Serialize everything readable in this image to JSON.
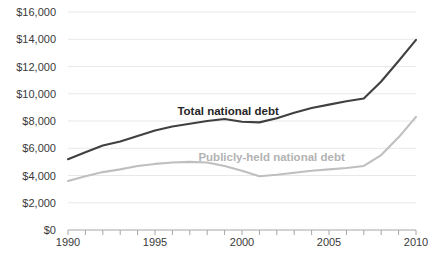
{
  "chart_data": {
    "type": "line",
    "title": "",
    "xlabel": "",
    "ylabel": "",
    "xlim": [
      1990,
      2010
    ],
    "ylim": [
      0,
      16000
    ],
    "grid": true,
    "legend_position": "inline-annotations",
    "y_ticks": [
      0,
      2000,
      4000,
      6000,
      8000,
      10000,
      12000,
      14000,
      16000
    ],
    "y_tick_labels": [
      "$0",
      "$2,000",
      "$4,000",
      "$6,000",
      "$8,000",
      "$10,000",
      "$12,000",
      "$14,000",
      "$16,000"
    ],
    "x_ticks": [
      1990,
      1991,
      1992,
      1993,
      1994,
      1995,
      1996,
      1997,
      1998,
      1999,
      2000,
      2001,
      2002,
      2003,
      2004,
      2005,
      2006,
      2007,
      2008,
      2009,
      2010
    ],
    "x_tick_labels_shown": [
      "1990",
      "1995",
      "2000",
      "2005",
      "2010"
    ],
    "x": [
      1990,
      1991,
      1992,
      1993,
      1994,
      1995,
      1996,
      1997,
      1998,
      1999,
      2000,
      2001,
      2002,
      2003,
      2004,
      2005,
      2006,
      2007,
      2008,
      2009,
      2010
    ],
    "series": [
      {
        "name": "Total national debt",
        "color": "#404040",
        "values": [
          5200,
          5700,
          6200,
          6500,
          6900,
          7300,
          7600,
          7800,
          8000,
          8150,
          7950,
          7900,
          8200,
          8600,
          8950,
          9200,
          9450,
          9650,
          10900,
          12400,
          13950
        ]
      },
      {
        "name": "Publicly-held national debt",
        "color": "#bfbfbf",
        "values": [
          3600,
          3950,
          4250,
          4450,
          4700,
          4850,
          4950,
          5000,
          4950,
          4700,
          4350,
          3950,
          4050,
          4200,
          4350,
          4450,
          4550,
          4700,
          5500,
          6800,
          8300
        ]
      }
    ],
    "annotations": [
      {
        "text": "Total national debt",
        "x": 1999.2,
        "y": 8700,
        "color": "#262626"
      },
      {
        "text": "Publicly-held national debt",
        "x": 2001.7,
        "y": 5350,
        "color": "#b3b3b3"
      }
    ]
  }
}
